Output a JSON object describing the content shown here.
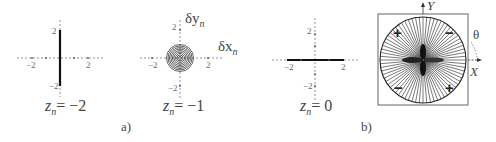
{
  "figure": {
    "panel_a": {
      "tag": "a)",
      "subplots": [
        {
          "z_label_var": "z",
          "z_label_sub": "n",
          "z_label_eq": "= −2",
          "ticks": {
            "x_neg": "−2",
            "x_pos": "2",
            "y_pos": "2",
            "y_neg": "−2"
          },
          "shape": "vertical-line"
        },
        {
          "z_label_var": "z",
          "z_label_sub": "n",
          "z_label_eq": "= −1",
          "ticks": {
            "x_neg": "−2",
            "x_pos": "2",
            "y_pos": "2",
            "y_neg": "−2"
          },
          "axis_x_name": "δx",
          "axis_x_sub": "n",
          "axis_y_name": "δy",
          "axis_y_sub": "n",
          "shape": "concentric-circles"
        },
        {
          "z_label_var": "z",
          "z_label_sub": "n",
          "z_label_eq": "= 0",
          "ticks": {
            "x_neg": "−2",
            "x_pos": "2",
            "y_pos": "2",
            "y_neg": "−2"
          },
          "shape": "horizontal-line"
        }
      ]
    },
    "panel_b": {
      "tag": "b)",
      "axis_y": "Y",
      "axis_x": "X",
      "angle": "θ",
      "quadrant_signs": {
        "top_left": "+",
        "top_right": "−",
        "bottom_left": "−",
        "bottom_right": "+"
      },
      "shape": "radial-lines-in-circle"
    }
  }
}
